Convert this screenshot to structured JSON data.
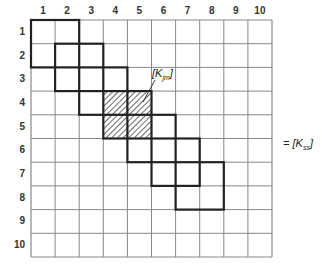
{
  "diagram": {
    "type": "matrix-assembly",
    "grid": {
      "rows": 10,
      "cols": 10,
      "left": 31,
      "top": 20,
      "cell_width": 24.1,
      "cell_height": 23.7,
      "grid_color": "#888888",
      "block_color": "#222222"
    },
    "column_labels": [
      "1",
      "2",
      "3",
      "4",
      "5",
      "6",
      "7",
      "8",
      "9",
      "10"
    ],
    "row_labels": [
      "1",
      "2",
      "3",
      "4",
      "5",
      "6",
      "7",
      "8",
      "9",
      "10"
    ],
    "element_blocks": [
      {
        "row_start": 1,
        "col_start": 1,
        "size": 2,
        "hatched": false
      },
      {
        "row_start": 2,
        "col_start": 2,
        "size": 2,
        "hatched": false
      },
      {
        "row_start": 3,
        "col_start": 3,
        "size": 2,
        "hatched": false
      },
      {
        "row_start": 4,
        "col_start": 4,
        "size": 2,
        "hatched": true
      },
      {
        "row_start": 5,
        "col_start": 5,
        "size": 2,
        "hatched": false
      },
      {
        "row_start": 6,
        "col_start": 6,
        "size": 2,
        "hatched": false
      },
      {
        "row_start": 7,
        "col_start": 7,
        "size": 2,
        "hatched": false
      }
    ],
    "element_label": {
      "prefix": "[K",
      "subscript": "jm",
      "suffix": "]"
    },
    "matrix_label": {
      "prefix": "= [K",
      "subscript": "ss",
      "suffix": "]"
    }
  }
}
